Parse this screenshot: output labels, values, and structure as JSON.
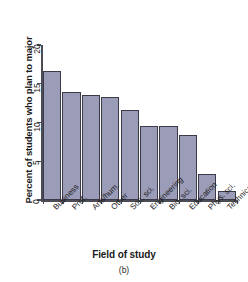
{
  "chart_data": {
    "type": "bar",
    "title": "",
    "subtitle": "",
    "xlabel": "Field of study",
    "ylabel": "Percent of students who plan to major",
    "caption": "(b)",
    "categories": [
      "Business",
      "Prof.",
      "Arts/hum.",
      "Other",
      "Soc. sci.",
      "Engineering",
      "Bio. sci.",
      "Education",
      "Phys. sci.",
      "Technical"
    ],
    "values": [
      16.7,
      13.9,
      13.6,
      13.3,
      11.6,
      9.6,
      9.5,
      8.4,
      3.3,
      1.1
    ],
    "ylim": [
      0,
      20
    ],
    "yticks": [
      0,
      5,
      10,
      15,
      20
    ],
    "ytick_labels": [
      "0",
      "5",
      "10",
      "15",
      "20"
    ],
    "grid": false,
    "legend": "none",
    "bar_color": "#9a9cb8",
    "bar_edge_color": "#3a3a48",
    "axis_color": "#4c4c55",
    "background": "#ffffff"
  }
}
